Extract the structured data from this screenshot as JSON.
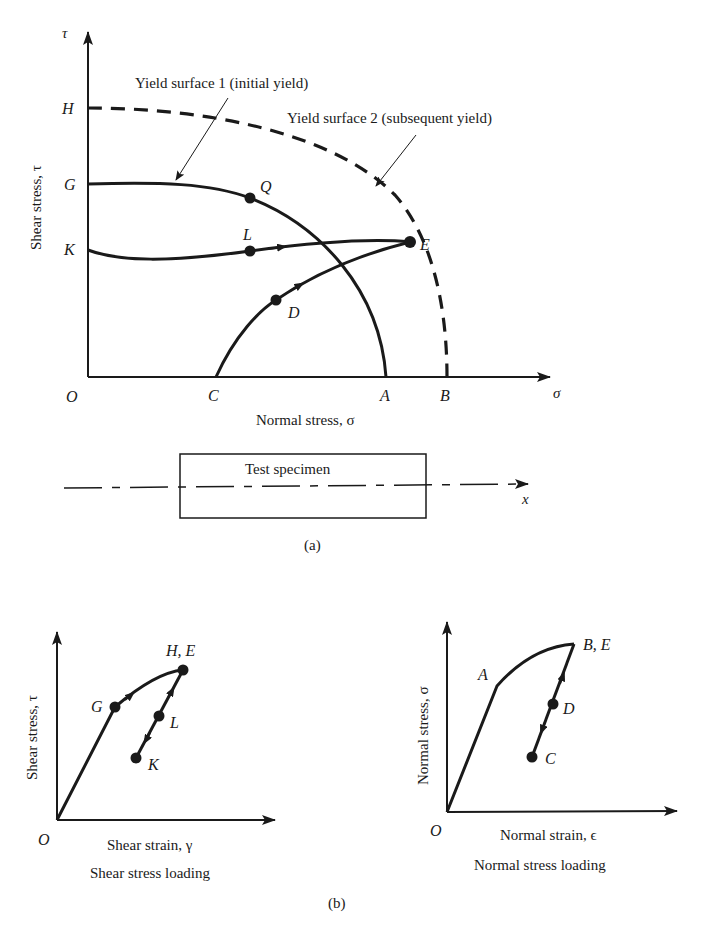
{
  "figure_a": {
    "caption": "(a)",
    "tau_axis_symbol": "τ",
    "sigma_axis_symbol": "σ",
    "y_axis_label": "Shear stress, τ",
    "x_axis_label": "Normal stress, σ",
    "yield_surface_1_label": "Yield surface 1 (initial yield)",
    "yield_surface_2_label": "Yield surface 2 (subsequent yield)",
    "points": {
      "O": "O",
      "H": "H",
      "G": "G",
      "K": "K",
      "Q": "Q",
      "L": "L",
      "E": "E",
      "D": "D",
      "A": "A",
      "B": "B",
      "C": "C"
    },
    "specimen_label": "Test specimen",
    "specimen_axis": "x"
  },
  "figure_b": {
    "caption": "(b)",
    "shear": {
      "y_axis_label": "Shear stress, τ",
      "x_axis_label": "Shear strain, γ",
      "title": "Shear stress loading",
      "points": {
        "O": "O",
        "G": "G",
        "HE": "H, E",
        "L": "L",
        "K": "K"
      }
    },
    "normal": {
      "y_axis_label": "Normal stress, σ",
      "x_axis_label": "Normal strain, ϵ",
      "title": "Normal stress loading",
      "points": {
        "O": "O",
        "A": "A",
        "BE": "B, E",
        "D": "D",
        "C": "C"
      }
    }
  },
  "colors": {
    "ink": "#1a1a1a",
    "background": "#ffffff"
  }
}
